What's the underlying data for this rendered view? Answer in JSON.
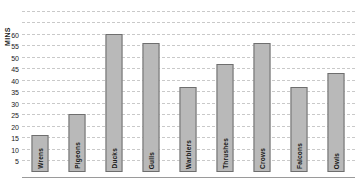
{
  "chart_data": {
    "type": "bar",
    "title": "",
    "xlabel": "",
    "ylabel": "MINS",
    "categories": [
      "Wrens",
      "Pigeons",
      "Ducks",
      "Gulls",
      "Warblers",
      "Thrushes",
      "Crows",
      "Falcons",
      "Owls"
    ],
    "values": [
      16,
      25,
      60,
      56,
      37,
      47,
      56,
      37,
      43
    ],
    "ylim": [
      0,
      72
    ],
    "yticks": [
      5,
      10,
      15,
      20,
      25,
      30,
      35,
      40,
      45,
      50,
      55,
      60
    ],
    "ytick_labels": [
      "5",
      "10",
      "15",
      "20",
      "25",
      "30",
      "35",
      "40",
      "45",
      "50",
      "55",
      "60"
    ],
    "extra_gridlines": [
      65,
      70
    ],
    "grid": true,
    "grid_style": "dashed",
    "legend": "none",
    "bar_fill_color": "#b9b9b9",
    "bar_border_color": "#6e6e6e",
    "grid_color": "#c9c9c9",
    "axis_color": "#9a9a9a",
    "text_color": "#1a1a1a",
    "background_color": "#ffffff",
    "label_orientation": "vertical",
    "labels_inside_bars": true
  }
}
